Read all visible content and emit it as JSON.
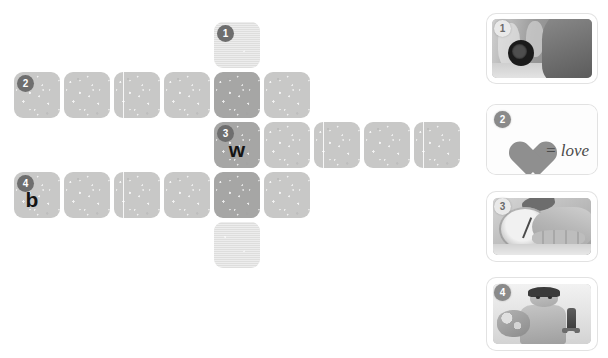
{
  "puzzle": {
    "type": "picture-crossword",
    "grid": {
      "cell_size": 46,
      "gap": 4,
      "origin_x": 14,
      "origin_y": 22
    },
    "tiles": [
      {
        "id": "t-r0c4",
        "col": 4,
        "row": 0,
        "shade": "shade-light",
        "texture": "scan",
        "badge": "1",
        "letter": "",
        "divider": false
      },
      {
        "id": "t-r1c0",
        "col": 0,
        "row": 1,
        "shade": "shade-mid",
        "texture": "tex",
        "badge": "2",
        "letter": "",
        "divider": false
      },
      {
        "id": "t-r1c1",
        "col": 1,
        "row": 1,
        "shade": "shade-mid",
        "texture": "tex",
        "badge": "",
        "letter": "",
        "divider": false
      },
      {
        "id": "t-r1c2",
        "col": 2,
        "row": 1,
        "shade": "shade-mid",
        "texture": "tex",
        "badge": "",
        "letter": "",
        "divider": true
      },
      {
        "id": "t-r1c3",
        "col": 3,
        "row": 1,
        "shade": "shade-mid",
        "texture": "tex",
        "badge": "",
        "letter": "",
        "divider": false
      },
      {
        "id": "t-r1c4",
        "col": 4,
        "row": 1,
        "shade": "shade-dark",
        "texture": "tex",
        "badge": "",
        "letter": "",
        "divider": false
      },
      {
        "id": "t-r1c5",
        "col": 5,
        "row": 1,
        "shade": "shade-mid",
        "texture": "tex",
        "badge": "",
        "letter": "",
        "divider": false
      },
      {
        "id": "t-r2c4",
        "col": 4,
        "row": 2,
        "shade": "shade-dark",
        "texture": "tex",
        "badge": "3",
        "letter": "w",
        "divider": false
      },
      {
        "id": "t-r2c5",
        "col": 5,
        "row": 2,
        "shade": "shade-mid",
        "texture": "tex",
        "badge": "",
        "letter": "",
        "divider": false
      },
      {
        "id": "t-r2c6",
        "col": 6,
        "row": 2,
        "shade": "shade-mid",
        "texture": "tex",
        "badge": "",
        "letter": "",
        "divider": true
      },
      {
        "id": "t-r2c7",
        "col": 7,
        "row": 2,
        "shade": "shade-mid",
        "texture": "tex",
        "badge": "",
        "letter": "",
        "divider": false
      },
      {
        "id": "t-r2c8",
        "col": 8,
        "row": 2,
        "shade": "shade-mid",
        "texture": "tex",
        "badge": "",
        "letter": "",
        "divider": true
      },
      {
        "id": "t-r3c0",
        "col": 0,
        "row": 3,
        "shade": "shade-mid",
        "texture": "tex",
        "badge": "4",
        "letter": "b",
        "divider": false
      },
      {
        "id": "t-r3c1",
        "col": 1,
        "row": 3,
        "shade": "shade-mid",
        "texture": "tex",
        "badge": "",
        "letter": "",
        "divider": false
      },
      {
        "id": "t-r3c2",
        "col": 2,
        "row": 3,
        "shade": "shade-mid",
        "texture": "tex",
        "badge": "",
        "letter": "",
        "divider": true
      },
      {
        "id": "t-r3c3",
        "col": 3,
        "row": 3,
        "shade": "shade-mid",
        "texture": "tex",
        "badge": "",
        "letter": "",
        "divider": false
      },
      {
        "id": "t-r3c4",
        "col": 4,
        "row": 3,
        "shade": "shade-dark",
        "texture": "tex",
        "badge": "",
        "letter": "",
        "divider": false
      },
      {
        "id": "t-r3c5",
        "col": 5,
        "row": 3,
        "shade": "shade-mid",
        "texture": "tex",
        "badge": "",
        "letter": "",
        "divider": false
      },
      {
        "id": "t-r4c4",
        "col": 4,
        "row": 4,
        "shade": "shade-light",
        "texture": "scan",
        "badge": "",
        "letter": "",
        "divider": false
      }
    ],
    "answers": {
      "clue_3_first_letter": "w",
      "clue_4_first_letter": "b"
    }
  },
  "clues": {
    "title": "",
    "cards": [
      {
        "number": "1",
        "id": "clue-card-1",
        "image_description": "photographer-with-camera",
        "caption": "",
        "badge_style": "on-photo",
        "top": 14,
        "height": 69
      },
      {
        "number": "2",
        "id": "clue-card-2",
        "image_description": "heart-equals-love",
        "caption": "= love",
        "badge_style": "plain",
        "top": 105,
        "height": 69
      },
      {
        "number": "3",
        "id": "clue-card-3",
        "image_description": "foot-on-bathroom-scale",
        "caption": "",
        "badge_style": "on-photo",
        "top": 192,
        "height": 69
      },
      {
        "number": "4",
        "id": "clue-card-4",
        "image_description": "boy-with-helmet-and-sword",
        "caption": "",
        "badge_style": "plain",
        "top": 278,
        "height": 72
      }
    ]
  },
  "colors": {
    "background": "#ffffff",
    "tile_light": "#dededd",
    "tile_mid": "#c8c8c7",
    "tile_dark": "#a6a6a5",
    "badge_grid": "#6e6e6e",
    "badge_clue": "#8a8a8a",
    "letter": "#141414",
    "caption_text": "#4b4b4b",
    "heart": "#8f8f8f"
  }
}
